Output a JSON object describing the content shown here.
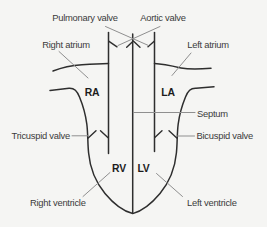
{
  "diagram": {
    "labels": {
      "pulmonary_valve": "Pulmonary valve",
      "aortic_valve": "Aortic valve",
      "right_atrium": "Right atrium",
      "left_atrium": "Left atrium",
      "ra_abbrev": "RA",
      "la_abbrev": "LA",
      "septum": "Septum",
      "tricuspid_valve": "Tricuspid valve",
      "bicuspid_valve": "Bicuspid valve",
      "rv_abbrev": "RV",
      "lv_abbrev": "LV",
      "right_ventricle": "Right ventricle",
      "left_ventricle": "Left ventricle"
    },
    "colors": {
      "background": "#f5f5f3",
      "structure_line": "#2e2e2e",
      "leader_line": "#8f8f8f",
      "label_text": "#3b3b3b",
      "abbrev_text": "#1c1c1c"
    }
  }
}
